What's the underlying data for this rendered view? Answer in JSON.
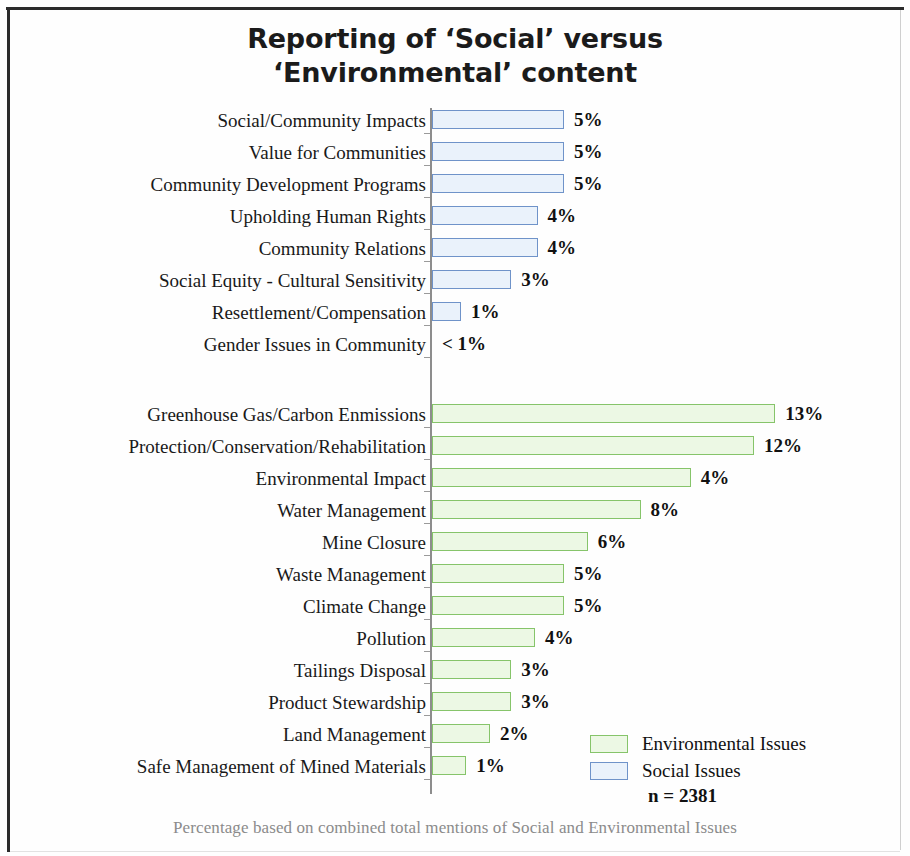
{
  "title": "Reporting of ‘Social’ versus ‘Environmental’ content",
  "title_line1": "Reporting of ‘Social’ versus",
  "title_line2": "‘Environmental’ content",
  "footnote": "Percentage based on combined total mentions of Social and Environmental Issues",
  "sample_size": "n = 2381",
  "legend": {
    "items": [
      {
        "label": "Environmental Issues",
        "color": "#ecf8e4",
        "border": "#86c46a"
      },
      {
        "label": "Social Issues",
        "color": "#eaf2fb",
        "border": "#6f93c9"
      }
    ]
  },
  "chart_data": {
    "type": "bar",
    "orientation": "horizontal",
    "title": "Reporting of ‘Social’ versus ‘Environmental’ content",
    "xlabel": "",
    "ylabel": "",
    "xlim": [
      0,
      13
    ],
    "grid": false,
    "legend_position": "bottom-right",
    "value_suffix": "%",
    "note": "Percentage based on combined total mentions of Social and Environmental Issues",
    "n": 2381,
    "series": [
      {
        "name": "Social Issues",
        "color": "#eaf2fb",
        "border": "#6f93c9",
        "points": [
          {
            "category": "Social/Community Impacts",
            "value": 5,
            "label": "5%",
            "bar_pct": 5.0
          },
          {
            "category": "Value for Communities",
            "value": 5,
            "label": "5%",
            "bar_pct": 5.0
          },
          {
            "category": "Community Development Programs",
            "value": 5,
            "label": "5%",
            "bar_pct": 5.0
          },
          {
            "category": "Upholding Human Rights",
            "value": 4,
            "label": "4%",
            "bar_pct": 4.0
          },
          {
            "category": "Community Relations",
            "value": 4,
            "label": "4%",
            "bar_pct": 4.0
          },
          {
            "category": "Social Equity - Cultural Sensitivity",
            "value": 3,
            "label": "3%",
            "bar_pct": 3.0
          },
          {
            "category": "Resettlement/Compensation",
            "value": 1,
            "label": "1%",
            "bar_pct": 1.1
          },
          {
            "category": "Gender Issues in Community",
            "value": 0.5,
            "label": "< 1%",
            "bar_pct": 0
          }
        ]
      },
      {
        "name": "Environmental Issues",
        "color": "#ecf8e4",
        "border": "#86c46a",
        "points": [
          {
            "category": "Greenhouse Gas/Carbon Enmissions",
            "value": 13,
            "label": "13%",
            "bar_pct": 13.0
          },
          {
            "category": "Protection/Conservation/Rehabilitation",
            "value": 12,
            "label": "12%",
            "bar_pct": 12.2
          },
          {
            "category": "Environmental Impact",
            "value": 4,
            "label": "4%",
            "bar_pct": 9.8
          },
          {
            "category": "Water Management",
            "value": 8,
            "label": "8%",
            "bar_pct": 7.9
          },
          {
            "category": "Mine Closure",
            "value": 6,
            "label": "6%",
            "bar_pct": 5.9
          },
          {
            "category": "Waste Management",
            "value": 5,
            "label": "5%",
            "bar_pct": 5.0
          },
          {
            "category": "Climate Change",
            "value": 5,
            "label": "5%",
            "bar_pct": 5.0
          },
          {
            "category": "Pollution",
            "value": 4,
            "label": "4%",
            "bar_pct": 3.9
          },
          {
            "category": "Tailings Disposal",
            "value": 3,
            "label": "3%",
            "bar_pct": 3.0
          },
          {
            "category": "Product Stewardship",
            "value": 3,
            "label": "3%",
            "bar_pct": 3.0
          },
          {
            "category": "Land Management",
            "value": 2,
            "label": "2%",
            "bar_pct": 2.2
          },
          {
            "category": "Safe Management of Mined Materials",
            "value": 1,
            "label": "1%",
            "bar_pct": 1.3
          }
        ]
      }
    ]
  }
}
